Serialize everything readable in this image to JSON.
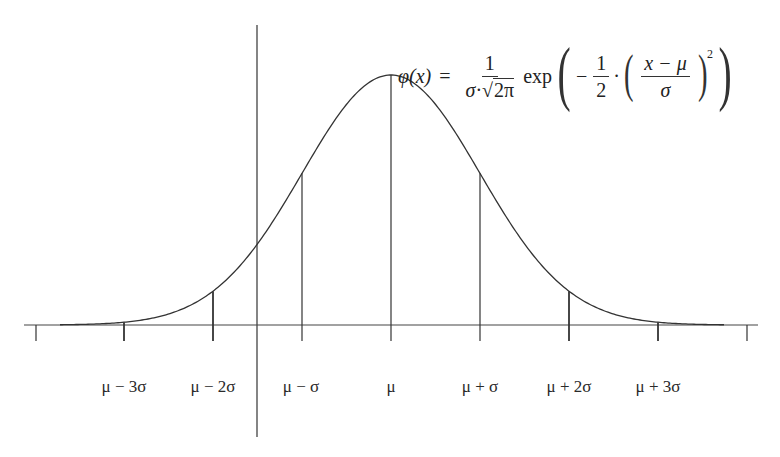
{
  "formula": {
    "lhs": "φ(x)",
    "equals": "=",
    "coef_numerator": "1",
    "coef_denominator_sigma": "σ",
    "coef_denominator_dot": "·",
    "coef_denominator_sqrt_sign": "√",
    "coef_denominator_sqrt_arg": "2π",
    "exp": "exp",
    "open_paren": "(",
    "minus": "−",
    "half_numerator": "1",
    "half_denominator": "2",
    "dot": "·",
    "inner_open": "(",
    "z_numerator": "x − μ",
    "z_denominator": "σ",
    "inner_close": ")",
    "exponent": "2",
    "close_paren": ")"
  },
  "axis": {
    "labels": [
      {
        "text": "μ − 3σ",
        "x": 124
      },
      {
        "text": "μ − 2σ",
        "x": 213
      },
      {
        "text": "μ − σ",
        "x": 301
      },
      {
        "text": "μ",
        "x": 391
      },
      {
        "text": "μ + σ",
        "x": 480
      },
      {
        "text": "μ + 2σ",
        "x": 569
      },
      {
        "text": "μ + 3σ",
        "x": 658
      }
    ]
  },
  "colors": {
    "line": "#333333",
    "background": "#ffffff"
  }
}
